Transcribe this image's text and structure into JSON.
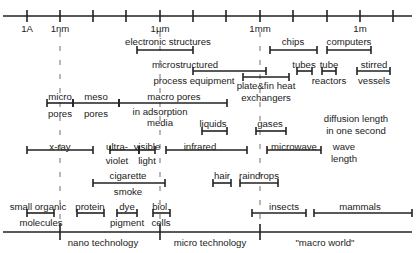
{
  "colors": {
    "line": "#222222",
    "dash": "#888888",
    "text": "#222222",
    "background": "#ffffff"
  },
  "axis": {
    "y": 16,
    "x_start": 3,
    "x_end": 412,
    "ticks_x": [
      27,
      60,
      93,
      126,
      160,
      193,
      226,
      260,
      293,
      327,
      360,
      393
    ],
    "labels": [
      {
        "text": "1A",
        "x": 27
      },
      {
        "text": "1nm",
        "x": 60
      },
      {
        "text": "1µm",
        "x": 160
      },
      {
        "text": "1mm",
        "x": 260
      },
      {
        "text": "1m",
        "x": 360
      }
    ]
  },
  "dashed_guides": [
    {
      "x": 60,
      "y1": 32,
      "y2": 220
    },
    {
      "x": 160,
      "y1": 32,
      "y2": 220
    },
    {
      "x": 260,
      "y1": 32,
      "y2": 220
    }
  ],
  "ranges": [
    {
      "name": "electronic-structures",
      "x1": 137,
      "x2": 193,
      "y": 50,
      "labels": [
        {
          "text": "electronic structures",
          "x": 168,
          "y": 36
        }
      ]
    },
    {
      "name": "chips",
      "x1": 270,
      "x2": 317,
      "y": 50,
      "labels": [
        {
          "text": "chips",
          "x": 293,
          "y": 36
        }
      ]
    },
    {
      "name": "computers",
      "x1": 327,
      "x2": 371,
      "y": 50,
      "labels": [
        {
          "text": "computers",
          "x": 349,
          "y": 36
        }
      ]
    },
    {
      "name": "microstructured-process-equipment",
      "x1": 193,
      "x2": 266,
      "y": 71,
      "labels": [
        {
          "text": "microstructured",
          "x": 185,
          "y": 59
        },
        {
          "text": "process equipment",
          "x": 194,
          "y": 75
        }
      ]
    },
    {
      "name": "plate-fin-heat-exchangers",
      "x1": 243,
      "x2": 289,
      "y": 77,
      "labels": [
        {
          "text": "plate&fin heat",
          "x": 266,
          "y": 80
        },
        {
          "text": "exchangers",
          "x": 266,
          "y": 92
        }
      ]
    },
    {
      "name": "tubes",
      "x1": 297,
      "x2": 312,
      "y": 71,
      "labels": [
        {
          "text": "tubes",
          "x": 304,
          "y": 59
        }
      ]
    },
    {
      "name": "tube-reactors",
      "x1": 322,
      "x2": 336,
      "y": 71,
      "labels": [
        {
          "text": "tube",
          "x": 329,
          "y": 59
        },
        {
          "text": "reactors",
          "x": 329,
          "y": 75
        }
      ]
    },
    {
      "name": "stirred-vessels",
      "x1": 357,
      "x2": 390,
      "y": 71,
      "labels": [
        {
          "text": "stirred",
          "x": 374,
          "y": 59
        },
        {
          "text": "vessels",
          "x": 374,
          "y": 75
        }
      ]
    },
    {
      "name": "micro-pores",
      "x1": 47,
      "x2": 73,
      "y": 103,
      "labels": [
        {
          "text": "micro",
          "x": 60,
          "y": 91
        },
        {
          "text": "pores",
          "x": 60,
          "y": 108
        }
      ]
    },
    {
      "name": "meso-pores",
      "x1": 73,
      "x2": 119,
      "y": 103,
      "labels": [
        {
          "text": "meso",
          "x": 96,
          "y": 91
        },
        {
          "text": "pores",
          "x": 96,
          "y": 108
        }
      ]
    },
    {
      "name": "macro-pores",
      "x1": 119,
      "x2": 227,
      "y": 103,
      "labels": [
        {
          "text": "macro pores",
          "x": 174,
          "y": 91
        },
        {
          "text": "in adsorption",
          "x": 160,
          "y": 106
        },
        {
          "text": "media",
          "x": 160,
          "y": 117
        }
      ]
    },
    {
      "name": "liquids",
      "x1": 202,
      "x2": 227,
      "y": 131,
      "labels": [
        {
          "text": "liquids",
          "x": 213,
          "y": 118
        }
      ]
    },
    {
      "name": "gases",
      "x1": 256,
      "x2": 286,
      "y": 131,
      "labels": [
        {
          "text": "gases",
          "x": 270,
          "y": 118
        }
      ]
    },
    {
      "name": "x-ray",
      "x1": 27,
      "x2": 93,
      "y": 150,
      "labels": [
        {
          "text": "x-ray",
          "x": 60,
          "y": 141
        }
      ]
    },
    {
      "name": "ultraviolet",
      "x1": 110,
      "x2": 139,
      "y": 150,
      "labels": [
        {
          "text": "ultra-",
          "x": 117,
          "y": 141
        },
        {
          "text": "violet",
          "x": 117,
          "y": 155
        }
      ]
    },
    {
      "name": "visible-light",
      "x1": 139,
      "x2": 155,
      "y": 150,
      "labels": [
        {
          "text": "visible",
          "x": 147,
          "y": 141
        },
        {
          "text": "light",
          "x": 147,
          "y": 155
        }
      ]
    },
    {
      "name": "infrared",
      "x1": 166,
      "x2": 247,
      "y": 150,
      "labels": [
        {
          "text": "infrared",
          "x": 200,
          "y": 141
        }
      ]
    },
    {
      "name": "microwave",
      "x1": 267,
      "x2": 321,
      "y": 150,
      "labels": [
        {
          "text": "microwave",
          "x": 294,
          "y": 141
        }
      ]
    },
    {
      "name": "cigarette-smoke",
      "x1": 93,
      "x2": 165,
      "y": 183,
      "labels": [
        {
          "text": "cigarette",
          "x": 128,
          "y": 170
        },
        {
          "text": "smoke",
          "x": 128,
          "y": 186
        }
      ]
    },
    {
      "name": "hair",
      "x1": 213,
      "x2": 231,
      "y": 183,
      "labels": [
        {
          "text": "hair",
          "x": 222,
          "y": 170
        }
      ]
    },
    {
      "name": "raindrops",
      "x1": 240,
      "x2": 278,
      "y": 183,
      "labels": [
        {
          "text": "raindrops",
          "x": 259,
          "y": 170
        }
      ]
    },
    {
      "name": "small-organic-molecules",
      "x1": 27,
      "x2": 54,
      "y": 213,
      "labels": [
        {
          "text": "small organic",
          "x": 38,
          "y": 201
        },
        {
          "text": "molecules",
          "x": 41,
          "y": 217
        }
      ]
    },
    {
      "name": "protein",
      "x1": 77,
      "x2": 104,
      "y": 213,
      "labels": [
        {
          "text": "protein",
          "x": 90,
          "y": 201
        }
      ]
    },
    {
      "name": "dye-pigment",
      "x1": 117,
      "x2": 137,
      "y": 213,
      "labels": [
        {
          "text": "dye",
          "x": 127,
          "y": 201
        },
        {
          "text": "pigment",
          "x": 127,
          "y": 217
        }
      ]
    },
    {
      "name": "biol-cells",
      "x1": 153,
      "x2": 170,
      "y": 213,
      "labels": [
        {
          "text": "biol.",
          "x": 161,
          "y": 201
        },
        {
          "text": "cells",
          "x": 161,
          "y": 217
        }
      ]
    },
    {
      "name": "insects",
      "x1": 252,
      "x2": 306,
      "y": 213,
      "labels": [
        {
          "text": "insects",
          "x": 284,
          "y": 201
        }
      ]
    },
    {
      "name": "mammals",
      "x1": 314,
      "x2": 412,
      "y": 213,
      "labels": [
        {
          "text": "mammals",
          "x": 360,
          "y": 201
        }
      ]
    }
  ],
  "annotations": [
    {
      "name": "diffusion-length-label",
      "lines": [
        "diffusion length",
        "in one second"
      ],
      "x": 356,
      "y": 113
    },
    {
      "name": "wave-length-label",
      "lines": [
        "wave",
        "length"
      ],
      "x": 344,
      "y": 141
    }
  ],
  "bottom_axis": {
    "y": 232,
    "x_start": 3,
    "x_end": 412,
    "ticks_x": [
      60,
      160,
      260
    ],
    "regions": [
      {
        "text": "nano technology",
        "x": 103,
        "y": 237
      },
      {
        "text": "micro technology",
        "x": 210,
        "y": 237
      },
      {
        "text": "\"macro world\"",
        "x": 325,
        "y": 237
      }
    ]
  }
}
